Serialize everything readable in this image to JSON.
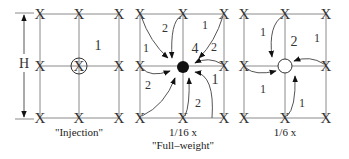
{
  "diagram": {
    "dimension_label": "H",
    "panels": [
      {
        "id": "injection",
        "caption_lines": [
          "\"Injection\""
        ],
        "center_marker": "circled-x",
        "cell_weights": [
          {
            "cell": "top-right",
            "value": "1"
          }
        ]
      },
      {
        "id": "full-weight",
        "caption_lines": [
          "1/16 x",
          "\"Full–weight\""
        ],
        "center_marker": "filled-dot",
        "cell_weights": [
          {
            "cell": "top-right-center",
            "value": "4"
          },
          {
            "cell": "top-left-arrow-a",
            "value": "1"
          },
          {
            "cell": "top-left-arrow-b",
            "value": "2"
          },
          {
            "cell": "top-right-arrow-a",
            "value": "1"
          },
          {
            "cell": "top-right-arrow-b",
            "value": "2"
          },
          {
            "cell": "bottom-left",
            "value": "2"
          },
          {
            "cell": "bottom-right-arrow-a",
            "value": "2"
          },
          {
            "cell": "bottom-right-arrow-b",
            "value": "1"
          }
        ]
      },
      {
        "id": "one-sixth",
        "caption_lines": [
          "1/6 x"
        ],
        "center_marker": "open-circle",
        "cell_weights": [
          {
            "cell": "top-left",
            "value": "1"
          },
          {
            "cell": "top-right-center",
            "value": "2"
          },
          {
            "cell": "top-right",
            "value": "1"
          },
          {
            "cell": "bottom-left",
            "value": "1"
          },
          {
            "cell": "bottom-right",
            "value": "1"
          }
        ]
      }
    ],
    "node_mark": "X"
  }
}
